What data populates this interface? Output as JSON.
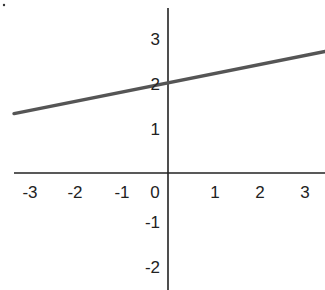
{
  "chart_data": {
    "type": "line",
    "title": "",
    "xlabel": "",
    "ylabel": "",
    "xlim": [
      -3.4,
      3.5
    ],
    "ylim": [
      -2.6,
      3.6
    ],
    "grid": false,
    "legend": null,
    "x_ticks": [
      "-3",
      "-2",
      "-1",
      "0",
      "1",
      "2",
      "3"
    ],
    "y_ticks": [
      "3",
      "2",
      "1",
      "-1",
      "-2"
    ],
    "series": [
      {
        "name": "y = 0.2x + 2",
        "slope": 0.2,
        "intercept": 2,
        "x": [
          -3.42,
          3.49
        ],
        "y": [
          1.32,
          2.7
        ],
        "color": "#555555"
      }
    ],
    "axis_color": "#222222"
  },
  "labels": {
    "x": [
      {
        "text": "-3",
        "px": 30
      },
      {
        "text": "-2",
        "px": 75
      },
      {
        "text": "-1",
        "px": 122
      },
      {
        "text": "0",
        "px": 155
      },
      {
        "text": "1",
        "px": 215
      },
      {
        "text": "2",
        "px": 260
      },
      {
        "text": "3",
        "px": 305
      }
    ],
    "y": [
      {
        "text": "3",
        "py": 45
      },
      {
        "text": "2",
        "py": 90
      },
      {
        "text": "1",
        "py": 135
      },
      {
        "text": "-1",
        "py": 228
      },
      {
        "text": "-2",
        "py": 273
      }
    ]
  }
}
